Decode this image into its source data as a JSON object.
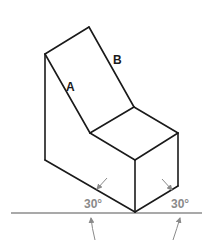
{
  "diagram": {
    "labels": {
      "edge_a": "A",
      "edge_b": "B"
    },
    "angles": {
      "left": "30°",
      "right": "30°"
    },
    "colors": {
      "edges": "#1a1a1a",
      "annotations": "#8a8a8a",
      "background": "#ffffff"
    }
  }
}
